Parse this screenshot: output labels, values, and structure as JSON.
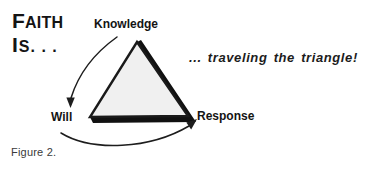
{
  "figure": {
    "title_line1_cap": "F",
    "title_line1_rest": "AITH",
    "title_line2_cap": "I",
    "title_line2_rest": "S. . .",
    "tagline": "... traveling the triangle!",
    "caption": "Figure 2.",
    "nodes": {
      "knowledge": "Knowledge",
      "will": "Will",
      "response": "Response"
    },
    "colors": {
      "background": "#ffffff",
      "ink": "#141414",
      "triangle_fill": "#f0f0f0",
      "triangle_outline": "#1a1a1a",
      "triangle_shadow": "#111111",
      "caption_ink": "#3a3a3a"
    },
    "geometry": {
      "triangle_apex": [
        137,
        42
      ],
      "triangle_bottom_left": [
        90,
        117
      ],
      "triangle_bottom_right": [
        188,
        116
      ],
      "arrow_knowledge_to_will": "curve from (116,38) down-left to arrowhead at (70,106) pointing down",
      "arrow_will_to_response": "curve from (62,134) right and up to arrowhead at (196,119) pointing up-right"
    },
    "icons": {
      "arrow_down_left": "arrow-knowledge-to-will-icon",
      "arrow_up_right": "arrow-will-to-response-icon"
    }
  }
}
